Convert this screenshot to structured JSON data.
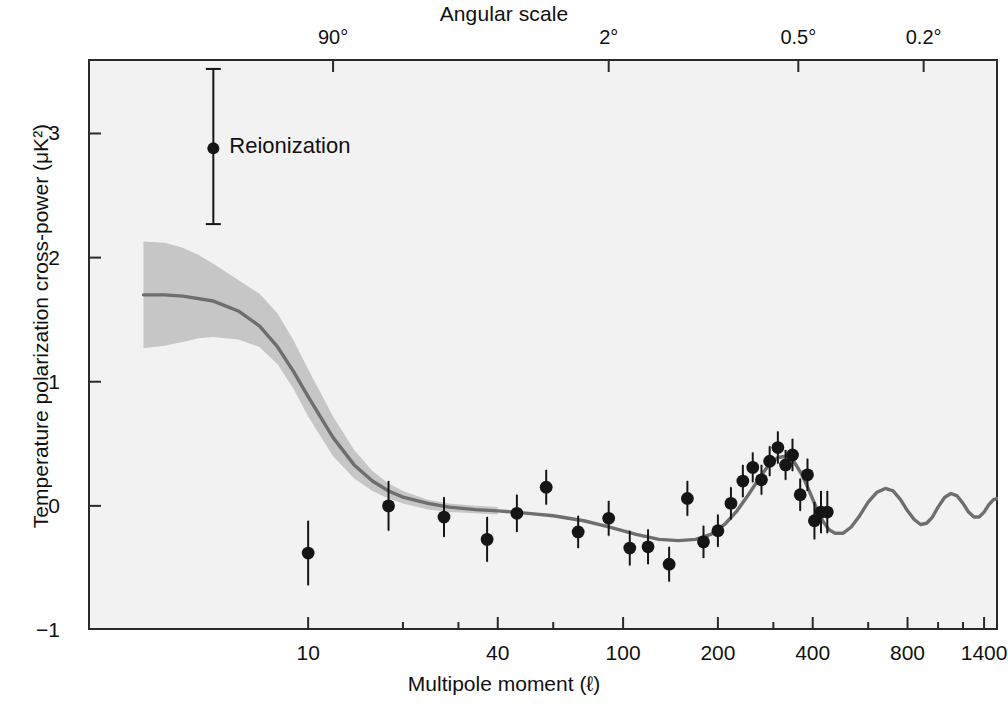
{
  "figure": {
    "top_axis_title": "Angular scale",
    "bottom_axis_title": "Multipole moment (ℓ)",
    "y_axis_title": "Temperature polarization cross-power (μK²)",
    "legend_label": "Reionization",
    "colors": {
      "plot_background": "#f2f2f2",
      "frame": "#2a2a2a",
      "model_curve": "#6e6e6e",
      "uncertainty_band": "#c6c6c6",
      "data_marker": "#151515",
      "error_bar": "#151515",
      "text": "#111111"
    }
  },
  "chart_data": {
    "type": "scatter",
    "title": "",
    "xlabel": "Multipole moment (ℓ)",
    "ylabel": "Temperature polarization cross-power (μK²)",
    "x_scale": "log",
    "xlim": [
      2,
      1550
    ],
    "ylim": [
      -1,
      3.6
    ],
    "grid": false,
    "legend_position": "inside-upper-left",
    "x_ticks_labeled": [
      10,
      40,
      100,
      200,
      400,
      800,
      1400
    ],
    "x_tick_labels": [
      "10",
      "40",
      "100",
      "200",
      "400",
      "800",
      "1400"
    ],
    "x_ticks_minor": [
      20,
      30,
      60,
      300,
      600,
      1000,
      1200
    ],
    "y_ticks": [
      -1,
      0,
      1,
      2,
      3
    ],
    "y_tick_labels": [
      "−1",
      "0",
      "1",
      "2",
      "3"
    ],
    "top_axis": {
      "label": "Angular scale",
      "ticks_l": [
        12,
        90,
        360,
        900
      ],
      "tick_labels": [
        "90°",
        "2°",
        "0.5°",
        "0.2°"
      ]
    },
    "series": [
      {
        "name": "Reionization",
        "type": "errorbar-point",
        "x": [
          5.0
        ],
        "y": [
          2.88
        ],
        "yerr_low": [
          0.61
        ],
        "yerr_high": [
          0.64
        ]
      },
      {
        "name": "WMAP TE binned data",
        "type": "errorbar-scatter",
        "x": [
          10,
          18,
          27,
          37,
          46,
          57,
          72,
          90,
          105,
          120,
          140,
          160,
          180,
          200,
          220,
          240,
          258,
          275,
          292,
          310,
          328,
          345,
          365,
          385,
          405,
          425,
          445
        ],
        "y": [
          -0.38,
          0.0,
          -0.09,
          -0.27,
          -0.06,
          0.15,
          -0.21,
          -0.1,
          -0.34,
          -0.33,
          -0.47,
          0.06,
          -0.29,
          -0.2,
          0.02,
          0.2,
          0.31,
          0.21,
          0.36,
          0.47,
          0.33,
          0.41,
          0.09,
          0.25,
          -0.12,
          -0.05,
          -0.05
        ],
        "yerr_low": [
          0.26,
          0.2,
          0.16,
          0.18,
          0.15,
          0.14,
          0.13,
          0.14,
          0.14,
          0.14,
          0.14,
          0.14,
          0.13,
          0.13,
          0.13,
          0.13,
          0.12,
          0.12,
          0.12,
          0.13,
          0.12,
          0.13,
          0.13,
          0.13,
          0.15,
          0.17,
          0.17
        ],
        "yerr_high": [
          0.26,
          0.2,
          0.16,
          0.18,
          0.15,
          0.14,
          0.13,
          0.14,
          0.14,
          0.14,
          0.14,
          0.14,
          0.13,
          0.13,
          0.13,
          0.13,
          0.12,
          0.12,
          0.12,
          0.13,
          0.12,
          0.13,
          0.13,
          0.13,
          0.15,
          0.17,
          0.17
        ]
      },
      {
        "name": "Best-fit model",
        "type": "line",
        "x": [
          3,
          3.5,
          4,
          5,
          6,
          7,
          8,
          9,
          10,
          12,
          14,
          16,
          18,
          20,
          24,
          28,
          34,
          40,
          50,
          60,
          75,
          90,
          110,
          130,
          150,
          170,
          190,
          210,
          230,
          250,
          270,
          290,
          310,
          330,
          350,
          370,
          390,
          410,
          430,
          450,
          470,
          500,
          530,
          560,
          600,
          640,
          680,
          720,
          760,
          800,
          840,
          880,
          920,
          960,
          1000,
          1050,
          1100,
          1150,
          1200,
          1250,
          1300,
          1350,
          1400,
          1450,
          1500,
          1550
        ],
        "y": [
          1.7,
          1.7,
          1.69,
          1.65,
          1.57,
          1.45,
          1.28,
          1.08,
          0.88,
          0.55,
          0.33,
          0.2,
          0.12,
          0.07,
          0.02,
          -0.01,
          -0.03,
          -0.04,
          -0.06,
          -0.08,
          -0.12,
          -0.17,
          -0.23,
          -0.27,
          -0.28,
          -0.27,
          -0.23,
          -0.15,
          -0.04,
          0.09,
          0.22,
          0.33,
          0.39,
          0.4,
          0.35,
          0.25,
          0.12,
          -0.01,
          -0.12,
          -0.19,
          -0.22,
          -0.22,
          -0.17,
          -0.09,
          0.03,
          0.11,
          0.14,
          0.12,
          0.05,
          -0.04,
          -0.11,
          -0.15,
          -0.14,
          -0.09,
          -0.01,
          0.07,
          0.1,
          0.08,
          0.02,
          -0.05,
          -0.09,
          -0.09,
          -0.05,
          0.01,
          0.05,
          0.06
        ]
      },
      {
        "name": "Model uncertainty band",
        "type": "band",
        "x": [
          3,
          3.5,
          4,
          4.5,
          5,
          6,
          7,
          8,
          9,
          10,
          12,
          14,
          16,
          18,
          20,
          24,
          28,
          34,
          40
        ],
        "y_upper": [
          2.13,
          2.12,
          2.08,
          2.02,
          1.95,
          1.82,
          1.71,
          1.55,
          1.33,
          1.1,
          0.72,
          0.45,
          0.28,
          0.18,
          0.12,
          0.05,
          0.02,
          0.0,
          -0.01
        ],
        "y_lower": [
          1.27,
          1.29,
          1.32,
          1.35,
          1.36,
          1.34,
          1.28,
          1.14,
          0.94,
          0.72,
          0.4,
          0.22,
          0.12,
          0.06,
          0.02,
          -0.03,
          -0.05,
          -0.06,
          -0.07
        ]
      }
    ]
  }
}
